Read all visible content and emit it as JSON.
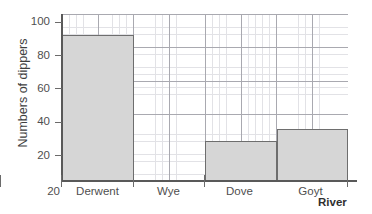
{
  "chart_data": {
    "type": "bar",
    "title": "",
    "subtitle": "",
    "xlabel": "River",
    "ylabel": "Numbers of dippers",
    "categories": [
      "Derwent",
      "Wye",
      "Dove",
      "Goyt"
    ],
    "values": [
      90,
      0,
      39,
      45
    ],
    "series": [
      {
        "name": "Numbers of dippers",
        "values": [
          90,
          0,
          39,
          45
        ]
      }
    ],
    "ylim": [
      20,
      100
    ],
    "xlim": [
      0,
      4
    ],
    "y_ticks": [
      20,
      40,
      60,
      80,
      100
    ],
    "y_tick_labels": [
      "20",
      "40",
      "60",
      "80",
      "100"
    ],
    "origin_label": "20",
    "grid": true,
    "grid_style": "graph-paper minor and major gridlines",
    "legend": false,
    "legend_position": "none",
    "annotations": [],
    "colors": {
      "bar_fill": "#d6d6d6",
      "bar_border": "#6e6e6e",
      "axis": "#595959",
      "major_grid": "#a9a9b0",
      "minor_grid": "#e2e2e6",
      "text": "#4f4f4f",
      "background": "#ffffff"
    }
  },
  "bars": [
    {
      "label": "Derwent",
      "value": 90,
      "value_label": "90"
    },
    {
      "label": "Wye",
      "value": 0,
      "value_label": "0"
    },
    {
      "label": "Dove",
      "value": 39,
      "value_label": "39"
    },
    {
      "label": "Goyt",
      "value": 45,
      "value_label": "45"
    }
  ],
  "y_axis": {
    "title": "Numbers of dippers",
    "ticks": [
      {
        "label": "100"
      },
      {
        "label": "80"
      },
      {
        "label": "60"
      },
      {
        "label": "40"
      },
      {
        "label": "20"
      }
    ],
    "origin_label": "20"
  },
  "x_axis": {
    "title": "River",
    "categories": [
      {
        "label": "Derwent"
      },
      {
        "label": "Wye"
      },
      {
        "label": "Dove"
      },
      {
        "label": "Goyt"
      }
    ]
  }
}
